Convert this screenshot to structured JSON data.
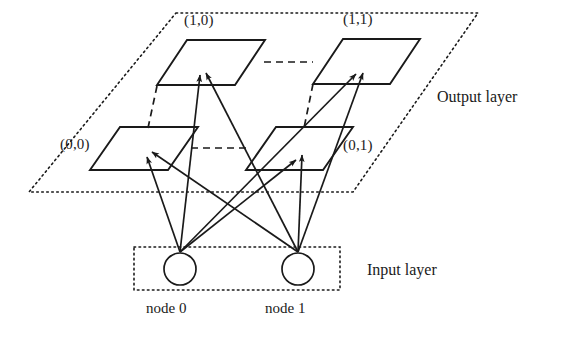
{
  "figure": {
    "type": "neural-network-diagram",
    "title_visible": false,
    "background_color": "#ffffff",
    "stroke_color": "#1a1a1a"
  },
  "output_layer": {
    "label": "Output layer",
    "plane_style": "dotted-parallelogram",
    "cells": [
      {
        "id": "cell-1-0",
        "label": "(1,0)",
        "row": "upper",
        "column": "left"
      },
      {
        "id": "cell-1-1",
        "label": "(1,1)",
        "row": "upper",
        "column": "right"
      },
      {
        "id": "cell-0-0",
        "label": "(0,0)",
        "row": "lower",
        "column": "left"
      },
      {
        "id": "cell-0-1",
        "label": "(0,1)",
        "row": "lower",
        "column": "right"
      }
    ]
  },
  "input_layer": {
    "label": "Input layer",
    "box_style": "dotted-rectangle",
    "nodes": [
      {
        "id": "node-0",
        "label": "node 0"
      },
      {
        "id": "node-1",
        "label": "node 1"
      }
    ]
  },
  "connections": {
    "style": "solid-arrow",
    "description": "each input node connects to all four output cells",
    "edges": [
      {
        "from": "node-0",
        "to": "cell-0-0"
      },
      {
        "from": "node-0",
        "to": "cell-1-0"
      },
      {
        "from": "node-0",
        "to": "cell-0-1"
      },
      {
        "from": "node-0",
        "to": "cell-1-1"
      },
      {
        "from": "node-1",
        "to": "cell-0-0"
      },
      {
        "from": "node-1",
        "to": "cell-1-0"
      },
      {
        "from": "node-1",
        "to": "cell-0-1"
      },
      {
        "from": "node-1",
        "to": "cell-1-1"
      }
    ]
  },
  "grid_guides": {
    "style": "dashed",
    "count": 4
  }
}
